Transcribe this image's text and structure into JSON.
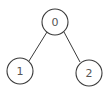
{
  "diagram": {
    "type": "binary-tree",
    "colors": {
      "stroke": "#3a3a3a",
      "label": "#555555",
      "background": "#ffffff"
    },
    "nodes": [
      {
        "id": "0",
        "label": "0",
        "cx": 55,
        "cy": 22,
        "r": 13
      },
      {
        "id": "1",
        "label": "1",
        "cx": 20,
        "cy": 71,
        "r": 13
      },
      {
        "id": "2",
        "label": "2",
        "cx": 89,
        "cy": 73,
        "r": 13
      }
    ],
    "edges": [
      {
        "from": "0",
        "to": "1"
      },
      {
        "from": "0",
        "to": "2"
      }
    ]
  }
}
